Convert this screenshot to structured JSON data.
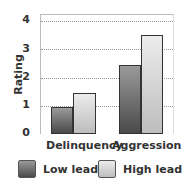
{
  "chart_data": {
    "type": "bar",
    "title": "",
    "xlabel": "",
    "ylabel": "Rating",
    "ylim": [
      0,
      4
    ],
    "yticks": [
      0,
      1,
      2,
      3,
      4
    ],
    "grid": true,
    "legend_position": "bottom",
    "categories": [
      "Delinquency",
      "Aggression"
    ],
    "series": [
      {
        "name": "Low lead",
        "values": [
          0.95,
          2.45
        ],
        "color": "#5a5a5a"
      },
      {
        "name": "High lead",
        "values": [
          1.45,
          3.5
        ],
        "color": "#d8d8d8"
      }
    ]
  },
  "axis": {
    "ylabel": "Rating",
    "ticks": [
      "0",
      "1",
      "2",
      "3",
      "4"
    ]
  },
  "categories": {
    "delinquency": "Delinquency",
    "aggression": "Aggression"
  },
  "legend": {
    "low": "Low lead",
    "high": "High lead"
  }
}
